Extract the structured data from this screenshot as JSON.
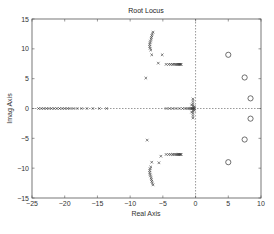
{
  "chart_data": {
    "type": "scatter",
    "title": "Root Locus",
    "xlabel": "Real Axis",
    "ylabel": "Imag Axis",
    "xlim": [
      -25,
      10
    ],
    "ylim": [
      -15,
      15
    ],
    "xticks": [
      -25,
      -20,
      -15,
      -10,
      -5,
      0,
      5,
      10
    ],
    "yticks": [
      -15,
      -10,
      -5,
      0,
      5,
      10,
      15
    ],
    "xtick_labels": [
      "−25",
      "−20",
      "−15",
      "−10",
      "−5",
      "0",
      "5",
      "10"
    ],
    "ytick_labels": [
      "−15",
      "−10",
      "−5",
      "0",
      "5",
      "10",
      "15"
    ],
    "grid": false,
    "legend": null,
    "reference_lines": [
      {
        "orientation": "horizontal",
        "value": 0,
        "style": "dotted"
      },
      {
        "orientation": "vertical",
        "value": 0,
        "style": "dotted"
      }
    ],
    "series": [
      {
        "name": "zeros",
        "marker": "o",
        "points": [
          [
            5.0,
            9.0
          ],
          [
            7.5,
            5.2
          ],
          [
            8.4,
            1.7
          ],
          [
            8.4,
            -1.7
          ],
          [
            7.5,
            -5.2
          ],
          [
            5.0,
            -9.0
          ]
        ]
      },
      {
        "name": "locus-upper-curve",
        "marker": "x",
        "points": [
          [
            -6.5,
            12.8
          ],
          [
            -6.6,
            12.5
          ],
          [
            -6.7,
            12.2
          ],
          [
            -6.75,
            11.9
          ],
          [
            -6.8,
            11.6
          ],
          [
            -6.9,
            11.3
          ],
          [
            -6.95,
            11.0
          ],
          [
            -7.0,
            10.7
          ],
          [
            -7.0,
            10.4
          ],
          [
            -6.95,
            10.1
          ],
          [
            -6.85,
            9.8
          ],
          [
            -6.7,
            9.0
          ]
        ]
      },
      {
        "name": "locus-upper-scattered",
        "marker": "x",
        "points": [
          [
            -5.1,
            9.0
          ],
          [
            -5.7,
            7.6
          ],
          [
            -7.6,
            5.1
          ]
        ]
      },
      {
        "name": "locus-upper-horizontal",
        "marker": "x",
        "points": [
          [
            -4.5,
            7.4
          ],
          [
            -4.1,
            7.4
          ],
          [
            -3.8,
            7.4
          ],
          [
            -3.5,
            7.4
          ],
          [
            -3.3,
            7.4
          ],
          [
            -3.1,
            7.4
          ],
          [
            -2.9,
            7.4
          ],
          [
            -2.75,
            7.4
          ],
          [
            -2.6,
            7.4
          ],
          [
            -2.5,
            7.4
          ],
          [
            -2.4,
            7.4
          ],
          [
            -2.3,
            7.4
          ],
          [
            -2.2,
            7.4
          ]
        ]
      },
      {
        "name": "locus-lower-curve",
        "marker": "x",
        "points": [
          [
            -6.5,
            -12.8
          ],
          [
            -6.6,
            -12.5
          ],
          [
            -6.7,
            -12.2
          ],
          [
            -6.75,
            -11.9
          ],
          [
            -6.8,
            -11.6
          ],
          [
            -6.9,
            -11.3
          ],
          [
            -6.95,
            -11.0
          ],
          [
            -7.0,
            -10.7
          ],
          [
            -7.0,
            -10.4
          ],
          [
            -6.95,
            -10.1
          ],
          [
            -6.85,
            -9.8
          ],
          [
            -6.7,
            -9.0
          ]
        ]
      },
      {
        "name": "locus-lower-scattered",
        "marker": "x",
        "points": [
          [
            -5.3,
            -8.0
          ],
          [
            -5.6,
            -9.1
          ],
          [
            -7.4,
            -5.3
          ]
        ]
      },
      {
        "name": "locus-lower-horizontal",
        "marker": "x",
        "points": [
          [
            -4.5,
            -7.7
          ],
          [
            -4.1,
            -7.7
          ],
          [
            -3.8,
            -7.7
          ],
          [
            -3.5,
            -7.7
          ],
          [
            -3.3,
            -7.7
          ],
          [
            -3.1,
            -7.7
          ],
          [
            -2.9,
            -7.7
          ],
          [
            -2.75,
            -7.7
          ],
          [
            -2.6,
            -7.7
          ],
          [
            -2.5,
            -7.7
          ],
          [
            -2.4,
            -7.7
          ],
          [
            -2.3,
            -7.7
          ],
          [
            -2.2,
            -7.7
          ]
        ]
      },
      {
        "name": "locus-real-axis-left",
        "marker": "x",
        "points": [
          [
            -24.0,
            0
          ],
          [
            -23.6,
            0
          ],
          [
            -23.2,
            0
          ],
          [
            -22.8,
            0
          ],
          [
            -22.4,
            0
          ],
          [
            -22.0,
            0
          ],
          [
            -21.6,
            0
          ],
          [
            -21.2,
            0
          ],
          [
            -20.8,
            0
          ],
          [
            -20.4,
            0
          ],
          [
            -20.0,
            0
          ],
          [
            -19.6,
            0
          ],
          [
            -19.2,
            0
          ],
          [
            -18.7,
            0
          ],
          [
            -18.1,
            0
          ],
          [
            -17.4,
            0
          ],
          [
            -16.6,
            0
          ],
          [
            -15.7,
            0
          ],
          [
            -14.7,
            0
          ],
          [
            -13.6,
            0
          ]
        ]
      },
      {
        "name": "locus-real-axis-near-origin",
        "marker": "x",
        "points": [
          [
            -4.5,
            0
          ],
          [
            -4.0,
            0
          ],
          [
            -3.5,
            0
          ],
          [
            -3.0,
            0
          ],
          [
            -2.5,
            0
          ],
          [
            -2.0,
            0
          ],
          [
            -1.6,
            0
          ],
          [
            -1.3,
            0
          ],
          [
            -1.0,
            0
          ],
          [
            -0.8,
            0
          ],
          [
            -0.6,
            0
          ],
          [
            -0.5,
            0
          ],
          [
            -0.4,
            0
          ],
          [
            -0.3,
            0
          ],
          [
            -0.2,
            0
          ]
        ]
      },
      {
        "name": "locus-origin-cluster",
        "marker": "x",
        "points": [
          [
            -0.4,
            1.6
          ],
          [
            -0.4,
            1.2
          ],
          [
            -0.4,
            0.8
          ],
          [
            -0.4,
            0.4
          ],
          [
            -0.4,
            -0.4
          ],
          [
            -0.4,
            -0.8
          ],
          [
            -0.4,
            -1.2
          ],
          [
            -0.4,
            -1.6
          ],
          [
            -0.6,
            0.6
          ],
          [
            -0.6,
            -0.6
          ],
          [
            -0.2,
            0.3
          ],
          [
            -0.2,
            -0.3
          ]
        ]
      }
    ]
  }
}
